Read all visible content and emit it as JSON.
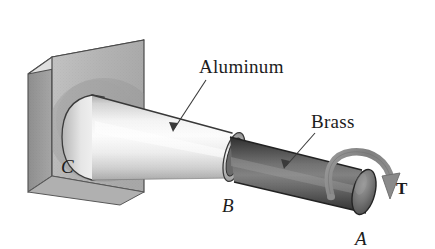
{
  "figure": {
    "background_color": "#ffffff"
  },
  "labels": {
    "aluminum": "Aluminum",
    "brass": "Brass",
    "point_c": "C",
    "point_b": "B",
    "point_a": "A",
    "torque": "T"
  },
  "parts": {
    "wall": {
      "name": "wall-support",
      "face_color": "#b9b9b9",
      "side_color": "#9a9a9a",
      "top_color": "#d8d8d8",
      "edge_color": "#4a4a4a"
    },
    "aluminum_tube": {
      "name": "aluminum-tube",
      "light_color": "#fbfbfb",
      "mid_color": "#e2e2e2",
      "dark_color": "#9f9f9f",
      "edge_color": "#3a3a3a"
    },
    "brass_rod": {
      "name": "brass-rod",
      "light_color": "#8d8d8d",
      "mid_color": "#5e5e5e",
      "dark_color": "#3c3c3c",
      "edge_color": "#262626"
    },
    "torque_arrow": {
      "name": "torque-arrow",
      "color": "#8a8a8a",
      "edge_color": "#6b6b6b",
      "direction": "clockwise"
    },
    "leader_lines": {
      "name": "leader-lines",
      "color": "#3a3a3a"
    }
  }
}
